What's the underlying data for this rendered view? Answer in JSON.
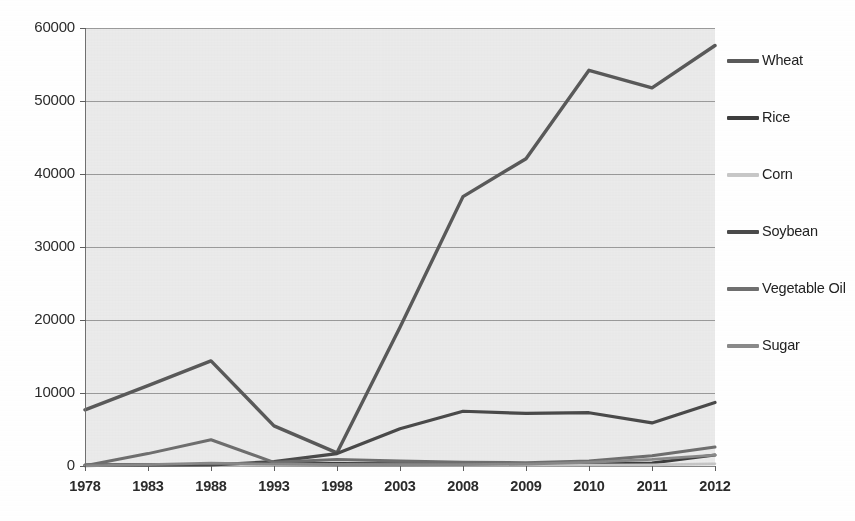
{
  "chart_data": {
    "type": "line",
    "title": "",
    "subtitle": "",
    "xlabel": "",
    "ylabel": "",
    "ylim": [
      0,
      60000
    ],
    "y_ticks": [
      "0",
      "10000",
      "20000",
      "30000",
      "40000",
      "50000",
      "60000"
    ],
    "y_tick_values": [
      0,
      10000,
      20000,
      30000,
      40000,
      50000,
      60000
    ],
    "grid": true,
    "grid_axis": "y",
    "legend_position": "right",
    "categories": [
      "1978",
      "1983",
      "1988",
      "1993",
      "1998",
      "2003",
      "2008",
      "2009",
      "2010",
      "2011",
      "2012"
    ],
    "series": [
      {
        "name": "Wheat",
        "color": "#5a5a5a",
        "width": 3.4,
        "values": [
          7700,
          11000,
          14400,
          5500,
          1800,
          19000,
          36900,
          42100,
          54200,
          51800,
          57600
        ]
      },
      {
        "name": "Rice",
        "color": "#3d3d3d",
        "width": 3.0,
        "values": [
          150,
          180,
          220,
          300,
          350,
          320,
          300,
          280,
          320,
          400,
          1500
        ]
      },
      {
        "name": "Corn",
        "color": "#c8c8c8",
        "width": 2.6,
        "values": [
          60,
          70,
          90,
          120,
          150,
          130,
          120,
          110,
          130,
          160,
          300
        ]
      },
      {
        "name": "Soybean",
        "color": "#4a4a4a",
        "width": 3.2,
        "values": [
          80,
          100,
          140,
          600,
          1700,
          5100,
          7500,
          7200,
          7300,
          5900,
          8700
        ]
      },
      {
        "name": "Vegetable Oil",
        "color": "#6f6f6f",
        "width": 3.0,
        "values": [
          40,
          1700,
          3600,
          500,
          900,
          700,
          500,
          450,
          700,
          1400,
          2600
        ]
      },
      {
        "name": "Sugar",
        "color": "#8a8a8a",
        "width": 2.8,
        "values": [
          30,
          200,
          400,
          250,
          200,
          180,
          200,
          260,
          500,
          900,
          1500
        ]
      }
    ]
  },
  "legend": {
    "entries": [
      {
        "label": "Wheat",
        "color": "#5a5a5a"
      },
      {
        "label": "Rice",
        "color": "#3d3d3d"
      },
      {
        "label": "Corn",
        "color": "#c8c8c8"
      },
      {
        "label": "Soybean",
        "color": "#4a4a4a"
      },
      {
        "label": "Vegetable Oil",
        "color": "#6f6f6f"
      },
      {
        "label": "Sugar",
        "color": "#8a8a8a"
      }
    ]
  },
  "style": {
    "plot_background": "#ededed",
    "gridline_color": "#8d8d8d",
    "axis_color": "#707070",
    "text_color": "#2b2b2b",
    "page_background": "#ffffff"
  }
}
